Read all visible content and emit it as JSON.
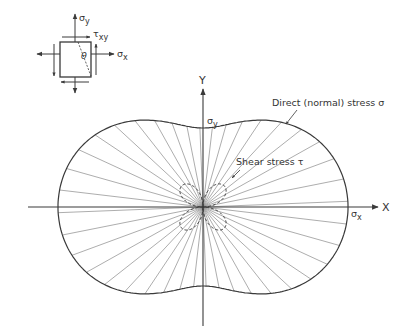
{
  "colors": {
    "ink": "#3a3a3a",
    "ray": "#8a8a8a",
    "background": "#ffffff"
  },
  "element": {
    "sigma_y_label": "σ",
    "sigma_y_sub": "y",
    "sigma_x_label": "σ",
    "sigma_x_sub": "x",
    "tau_label": "τ",
    "tau_sub": "xy",
    "theta_label": "θ"
  },
  "axes": {
    "x_label": "X",
    "y_label": "Y",
    "sigma_x_label": "σ",
    "sigma_x_sub": "x",
    "sigma_y_label": "σ",
    "sigma_y_sub": "y"
  },
  "annotations": {
    "normal_stress": "Direct (normal) stress σ",
    "shear_stress": "Shear stress τ"
  },
  "geometry": {
    "center": [
      203,
      207
    ],
    "sigma_x_extent": 145,
    "sigma_y_extent": 79,
    "shear_extent": 19,
    "ray_count": 40
  }
}
